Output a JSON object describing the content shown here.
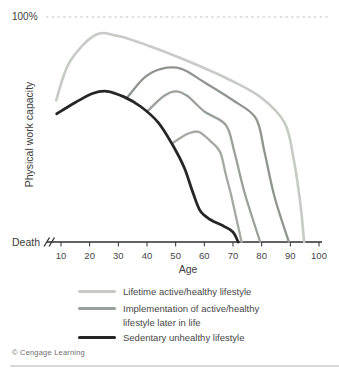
{
  "chart_data": {
    "type": "line",
    "xlabel": "Age",
    "ylabel": "Physical work capacity",
    "y_top_label": "100%",
    "y_bottom_label": "Death",
    "x_ticks": [
      10,
      20,
      30,
      40,
      50,
      60,
      70,
      80,
      90,
      100
    ],
    "x_range": [
      10,
      100
    ],
    "y_range_percent": [
      0,
      100
    ],
    "grid": false,
    "axis_break_before_first_tick": true,
    "reference_line": {
      "label": "100%",
      "value_percent": 100,
      "style": "dashed",
      "color": "#c0c4c0"
    },
    "legend_position": "bottom",
    "series": [
      {
        "key": "lifetime-active",
        "name": "Lifetime active/healthy lifestyle",
        "color": "#c6ccc5",
        "width": 2.6,
        "points_age_percent": [
          [
            8.3,
            63
          ],
          [
            13,
            80
          ],
          [
            22,
            92
          ],
          [
            30,
            91.5
          ],
          [
            41,
            87
          ],
          [
            55,
            80
          ],
          [
            69,
            72
          ],
          [
            80,
            64
          ],
          [
            88,
            53
          ],
          [
            91,
            38
          ],
          [
            93.5,
            17
          ],
          [
            94.8,
            0
          ]
        ]
      },
      {
        "key": "implement-age33",
        "name": "Implementation of active/healthy lifestyle later in life (begun ~33)",
        "color": "#8f958f",
        "width": 2.3,
        "points_age_percent": [
          [
            33,
            64
          ],
          [
            39,
            73
          ],
          [
            45,
            77
          ],
          [
            52,
            77
          ],
          [
            60,
            71
          ],
          [
            70,
            63
          ],
          [
            78,
            55
          ],
          [
            81,
            40
          ],
          [
            84.5,
            20
          ],
          [
            89.5,
            0
          ]
        ]
      },
      {
        "key": "implement-age40",
        "name": "Implementation of active/healthy lifestyle later in life (begun ~40)",
        "color": "#9aa09a",
        "width": 2.3,
        "points_age_percent": [
          [
            40,
            58
          ],
          [
            46,
            65
          ],
          [
            50,
            67
          ],
          [
            54,
            65
          ],
          [
            60,
            58
          ],
          [
            67.5,
            52
          ],
          [
            70.5,
            40
          ],
          [
            74,
            22
          ],
          [
            79.5,
            0
          ]
        ]
      },
      {
        "key": "implement-age49",
        "name": "Implementation of active/healthy lifestyle later in life (begun ~49)",
        "color": "#a4a9a3",
        "width": 2.3,
        "points_age_percent": [
          [
            49,
            44
          ],
          [
            54,
            48
          ],
          [
            58,
            49
          ],
          [
            62,
            45
          ],
          [
            65.5,
            40
          ],
          [
            67.5,
            30
          ],
          [
            69.5,
            20
          ],
          [
            73,
            0
          ]
        ]
      },
      {
        "key": "sedentary",
        "name": "Sedentary unhealthy lifestyle",
        "color": "#262626",
        "width": 2.8,
        "points_age_percent": [
          [
            8.5,
            57
          ],
          [
            15,
            62
          ],
          [
            21,
            66
          ],
          [
            26,
            67
          ],
          [
            32,
            64.5
          ],
          [
            38,
            60
          ],
          [
            44,
            53
          ],
          [
            49,
            43
          ],
          [
            53,
            33
          ],
          [
            56,
            22
          ],
          [
            58.5,
            14
          ],
          [
            62,
            10
          ],
          [
            66,
            7.5
          ],
          [
            69,
            5.5
          ],
          [
            70.5,
            3.5
          ],
          [
            71.8,
            0
          ]
        ]
      }
    ],
    "legend": [
      {
        "label": "Lifetime active/healthy lifestyle",
        "color": "#c6ccc5"
      },
      {
        "label": "Implementation of active/healthy",
        "label_line2": "lifestyle later in life",
        "color": "#9aa09a"
      },
      {
        "label": "Sedentary unhealthy lifestyle",
        "color": "#262626"
      }
    ],
    "colors": {
      "axis": "#2e2e2e",
      "text": "#404040",
      "tick_text": "#454545",
      "credit_text": "#6d6d6d"
    }
  },
  "footer": {
    "credit": "© Cengage Learning"
  }
}
